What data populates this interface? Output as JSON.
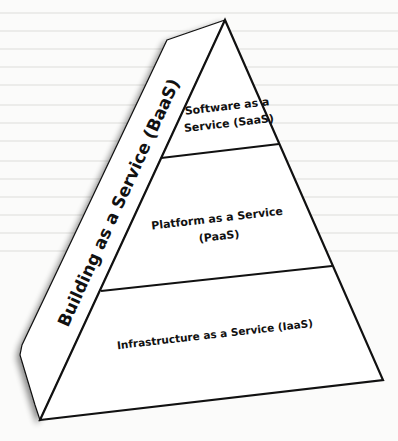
{
  "diagram": {
    "type": "pyramid",
    "side_panel": {
      "label": "Building as a Service (BaaS)"
    },
    "layers": [
      {
        "id": "saas",
        "line1": "Software as a",
        "line2": "Service (SaaS)"
      },
      {
        "id": "paas",
        "line1": "Platform as a Service",
        "line2": "(PaaS)"
      },
      {
        "id": "iaas",
        "line1": "Infrastructure as a Service (IaaS)"
      }
    ],
    "colors": {
      "stroke": "#111111",
      "fill": "#ffffff",
      "background": "#fbfbfa"
    }
  }
}
